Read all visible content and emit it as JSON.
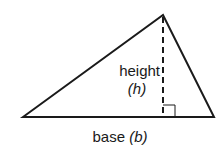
{
  "diagram": {
    "type": "triangle-area-figure",
    "labels": {
      "height_word": "height",
      "height_symbol": "(h)",
      "base_word": "base",
      "base_symbol": "(b)"
    },
    "geometry": {
      "apex": [
        163,
        15
      ],
      "bottom_left": [
        23,
        117
      ],
      "bottom_right": [
        214,
        117
      ],
      "height_foot": [
        163,
        117
      ],
      "right_angle_marker_size": 12
    },
    "styles": {
      "stroke_color": "#1a1a1a",
      "background_color": "#ffffff",
      "height_line": "dashed"
    }
  }
}
